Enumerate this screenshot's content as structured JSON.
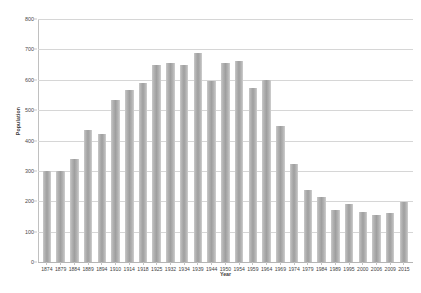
{
  "chart_data": {
    "type": "bar",
    "title": "",
    "xlabel": "Year",
    "ylabel": "Population",
    "ylim": [
      0,
      800
    ],
    "ytick_step": 100,
    "yticks": [
      0,
      100,
      200,
      300,
      400,
      500,
      600,
      700,
      800
    ],
    "grid": true,
    "legend": false,
    "bar_color": "#a8a8a8",
    "categories": [
      "1874",
      "1879",
      "1884",
      "1889",
      "1894",
      "1910",
      "1914",
      "1918",
      "1925",
      "1932",
      "1934",
      "1939",
      "1944",
      "1950",
      "1954",
      "1959",
      "1964",
      "1969",
      "1974",
      "1979",
      "1984",
      "1989",
      "1995",
      "2000",
      "2006",
      "2009",
      "2015"
    ],
    "values": [
      300,
      300,
      340,
      435,
      423,
      532,
      565,
      590,
      650,
      655,
      648,
      688,
      595,
      655,
      662,
      572,
      598,
      447,
      322,
      237,
      215,
      172,
      190,
      165,
      155,
      163,
      198
    ]
  },
  "caption": {
    "text": ""
  }
}
